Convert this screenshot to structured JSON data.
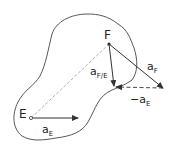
{
  "diagram": {
    "points": {
      "E": {
        "label": "E",
        "x": 31,
        "y": 118
      },
      "F": {
        "label": "F",
        "x": 109,
        "y": 44
      }
    },
    "vectors": {
      "a_E": {
        "symbol": "a",
        "subscript": "E"
      },
      "a_F": {
        "symbol": "a",
        "subscript": "F"
      },
      "a_FE": {
        "symbol": "a",
        "subscript": "F/E"
      },
      "neg_a_E": {
        "prefix": "−",
        "symbol": "a",
        "subscript": "E"
      }
    },
    "colors": {
      "stroke": "#333333",
      "background": "#ffffff"
    }
  }
}
